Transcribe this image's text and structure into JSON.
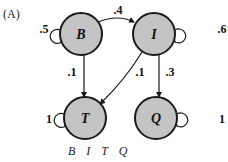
{
  "panel_label": "(A)",
  "legend": "B I T Q",
  "colors": {
    "node_fill": "#c4c4c4",
    "stroke": "#1a1a1a"
  },
  "nodes": [
    {
      "id": "B",
      "label": "B",
      "cx": 81,
      "cy": 34
    },
    {
      "id": "I",
      "label": "I",
      "cx": 154,
      "cy": 34
    },
    {
      "id": "T",
      "label": "T",
      "cx": 85,
      "cy": 118
    },
    {
      "id": "Q",
      "label": "Q",
      "cx": 156,
      "cy": 118
    }
  ],
  "edges": [
    {
      "from": "B",
      "to": "B",
      "weight": ".5"
    },
    {
      "from": "B",
      "to": "I",
      "weight": ".4"
    },
    {
      "from": "B",
      "to": "T",
      "weight": ".1"
    },
    {
      "from": "I",
      "to": "I",
      "weight": ".6"
    },
    {
      "from": "I",
      "to": "T",
      "weight": ".1"
    },
    {
      "from": "I",
      "to": "Q",
      "weight": ".3"
    },
    {
      "from": "T",
      "to": "T",
      "weight": "1"
    },
    {
      "from": "Q",
      "to": "Q",
      "weight": "1"
    }
  ]
}
